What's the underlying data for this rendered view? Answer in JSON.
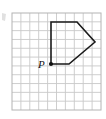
{
  "figure": {
    "background_color": "#ffffff",
    "grid": {
      "name": "square-grid",
      "line_color": "#c8c8c8",
      "border_color": "#b4b4b4",
      "cell_size_px": 8.9,
      "origin_x_px": 12,
      "origin_y_px": 13,
      "columns": 10,
      "rows": 11,
      "width_px": 89,
      "height_px": 97
    },
    "shape": {
      "name": "pentagon-arrow",
      "type": "polygon",
      "sides": 5,
      "stroke_color": "#1a1a1a",
      "stroke_width_px": 1.6,
      "fill": "none",
      "points_px": "51,22 77,22 95,42 69,64 51,64",
      "vertices": [
        {
          "id": "top-left",
          "x_px": 51,
          "y_px": 22,
          "grid_x": 4.4,
          "grid_y": 1.0
        },
        {
          "id": "top-right",
          "x_px": 77,
          "y_px": 22,
          "grid_x": 7.3,
          "grid_y": 1.0
        },
        {
          "id": "apex-right",
          "x_px": 95,
          "y_px": 42,
          "grid_x": 9.3,
          "grid_y": 3.3
        },
        {
          "id": "bottom-right",
          "x_px": 69,
          "y_px": 64,
          "grid_x": 6.4,
          "grid_y": 5.7
        },
        {
          "id": "point-p",
          "x_px": 51,
          "y_px": 64,
          "grid_x": 4.4,
          "grid_y": 5.7
        }
      ]
    },
    "marked_point": {
      "name": "point-p",
      "label": "P",
      "x_px": 51,
      "y_px": 64,
      "dot_radius_px": 2.1,
      "dot_color": "#111111",
      "label_x_px": 38,
      "label_y_px": 68
    },
    "artifact": {
      "name": "left-edge-artifact",
      "x_px": 2,
      "y_px": 13,
      "width_px": 5,
      "height_px": 8,
      "color": "#cccccc"
    }
  }
}
